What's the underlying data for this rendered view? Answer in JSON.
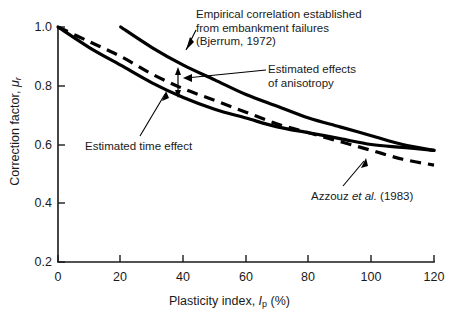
{
  "chart_data": {
    "type": "line",
    "title": "",
    "xlabel": "Plasticity index, Ip (%)",
    "ylabel": "Correction factor, μr",
    "xlim": [
      0,
      120
    ],
    "ylim": [
      0.2,
      1.0
    ],
    "xticks": [
      "0",
      "20",
      "40",
      "60",
      "80",
      "100",
      "120"
    ],
    "yticks": [
      "1.0",
      "0.8",
      "0.6",
      "0.4",
      "0.2"
    ],
    "grid": false,
    "legend_position": "none",
    "series": [
      {
        "name": "Empirical correlation established from embankment failures (Bjerrum, 1972)",
        "style": "solid",
        "x": [
          20,
          30,
          40,
          50,
          60,
          70,
          80,
          90,
          100,
          110,
          120
        ],
        "values": [
          1.0,
          0.93,
          0.87,
          0.82,
          0.77,
          0.73,
          0.69,
          0.66,
          0.63,
          0.6,
          0.58
        ]
      },
      {
        "name": "Estimated time effect",
        "style": "solid",
        "x": [
          0,
          10,
          20,
          30,
          40,
          50,
          60,
          70,
          80,
          90,
          100,
          110,
          120
        ],
        "values": [
          1.0,
          0.93,
          0.87,
          0.81,
          0.76,
          0.72,
          0.69,
          0.66,
          0.64,
          0.62,
          0.6,
          0.59,
          0.58
        ]
      },
      {
        "name": "Azzouz et al. (1983)",
        "style": "dashed",
        "x": [
          0,
          10,
          20,
          30,
          40,
          50,
          60,
          70,
          80,
          90,
          100,
          110,
          120
        ],
        "values": [
          1.0,
          0.95,
          0.9,
          0.84,
          0.79,
          0.75,
          0.71,
          0.67,
          0.64,
          0.61,
          0.58,
          0.55,
          0.53
        ]
      }
    ],
    "annotations": [
      {
        "id": "bjerrum",
        "text": "Empirical correlation established\nfrom embankment failures\n(Bjerrum, 1972)",
        "points_to": "bjerrum-curve"
      },
      {
        "id": "anisotropy",
        "text": "Estimated effects\nof anisotropy",
        "points_to": "anisotropy-arrow"
      },
      {
        "id": "time-effect",
        "text": "Estimated time effect",
        "points_to": "time-effect-curve"
      },
      {
        "id": "azzouz",
        "text_prefix": "Azzouz ",
        "text_italic": "et al.",
        "text_suffix": " (1983)",
        "points_to": "azzouz-curve"
      }
    ],
    "colors": {
      "curve": "#000000",
      "axis": "#1a1a1a",
      "background": "#ffffff"
    }
  },
  "axis": {
    "x_label_prefix": "Plasticity index, ",
    "x_label_symbol": "I",
    "x_label_sub": "p",
    "x_label_suffix": " (%)",
    "y_label_prefix": "Correction factor, ",
    "y_label_symbol": "μ",
    "y_label_sub": "r"
  }
}
